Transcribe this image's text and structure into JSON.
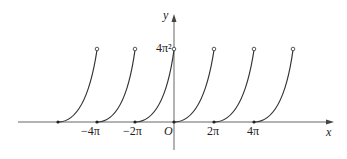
{
  "diagram": {
    "axes": {
      "x_label": "x",
      "y_label": "y",
      "origin_label": "O"
    },
    "x_ticks": [
      "-4π",
      "-2π",
      "2π",
      "4π"
    ],
    "y_ticks": [
      "4π²"
    ],
    "segments": [
      {
        "start": "-6π",
        "end": "-4π"
      },
      {
        "start": "-4π",
        "end": "-2π"
      },
      {
        "start": "-2π",
        "end": "0"
      },
      {
        "start": "0",
        "end": "2π"
      },
      {
        "start": "2π",
        "end": "4π"
      },
      {
        "start": "4π",
        "end": "6π"
      }
    ],
    "colors": {
      "curve": "#333333",
      "axis": "#555555"
    }
  },
  "labels": {
    "y_axis": "y",
    "x_axis": "x",
    "origin": "O",
    "tick_m4pi": "−4π",
    "tick_m2pi": "−2π",
    "tick_2pi": "2π",
    "tick_4pi": "4π",
    "tick_4pi2": "4π²"
  }
}
